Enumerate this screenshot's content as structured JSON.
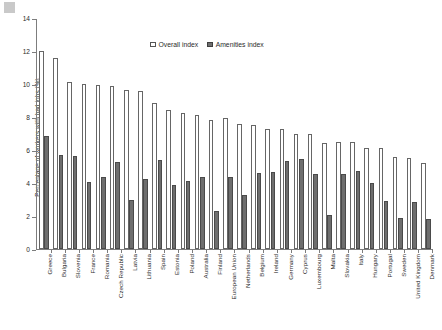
{
  "chart_data": {
    "type": "bar",
    "title": "",
    "subtitle": "",
    "xlabel": "",
    "ylabel": "Percentage of workers with bad jobs (%)",
    "ylim": [
      0,
      14
    ],
    "yticks": [
      0,
      2,
      4,
      6,
      8,
      10,
      12,
      14
    ],
    "grid": false,
    "legend_position": "top-center",
    "categories": [
      "Greece",
      "Bulgaria",
      "Slovenia",
      "France",
      "Romania",
      "Czech Republic",
      "Latvia",
      "Lithuania",
      "Spain",
      "Estonia",
      "Poland",
      "Australia",
      "Finland",
      "European Union",
      "Netherlands",
      "Belgium",
      "Ireland",
      "Germany",
      "Cyprus",
      "Luxembourg",
      "Malta",
      "Slovakia",
      "Italy",
      "Hungary",
      "Portugal",
      "Sweden",
      "United Kingdom",
      "Denmark"
    ],
    "series": [
      {
        "name": "Overall index",
        "color": "#ffffff",
        "edge_color": "#666666",
        "values": [
          12.0,
          11.6,
          10.1,
          10.0,
          9.95,
          9.9,
          9.65,
          9.55,
          8.85,
          8.4,
          8.25,
          8.1,
          7.8,
          7.95,
          7.6,
          7.5,
          7.3,
          7.25,
          7.0,
          7.0,
          6.4,
          6.5,
          6.5,
          6.15,
          6.1,
          5.6,
          5.5,
          5.2
        ]
      },
      {
        "name": "Amenities index",
        "color": "#6e6e6e",
        "edge_color": "#4a4a4a",
        "values": [
          6.85,
          5.7,
          5.65,
          4.05,
          4.35,
          5.25,
          2.95,
          4.25,
          5.4,
          3.85,
          4.1,
          4.35,
          2.3,
          4.35,
          3.25,
          4.6,
          4.65,
          5.35,
          5.45,
          4.55,
          2.05,
          4.55,
          4.7,
          4.0,
          2.9,
          1.85,
          2.85,
          1.8
        ]
      }
    ],
    "legend": [
      {
        "label": "Overall index",
        "swatch": "open"
      },
      {
        "label": "Amenities index",
        "swatch": "filled"
      }
    ]
  }
}
